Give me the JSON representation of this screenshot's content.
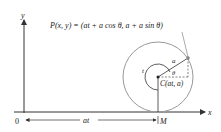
{
  "figure": {
    "axes": {
      "x_label": "x",
      "y_label": "y",
      "origin_label": "0"
    },
    "point_P_label": "P(x, y) = (at + a cos θ, a + a sin θ)",
    "center_label": "C(at, a)",
    "radius_label": "a",
    "angle_label": "θ",
    "arc_label": "t",
    "distance_label": "at",
    "M_label": "M",
    "colors": {
      "circle": "#999999",
      "lines": "#333333",
      "axis": "#333333"
    }
  }
}
